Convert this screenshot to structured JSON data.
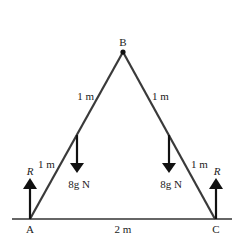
{
  "diagram": {
    "points": {
      "apex": "B",
      "left_base": "A",
      "right_base": "C"
    },
    "labels": {
      "B": "B",
      "A": "A",
      "C": "C",
      "upper_left_length": "1 m",
      "upper_right_length": "1 m",
      "lower_left_length": "1 m",
      "lower_right_length": "1 m",
      "base_length": "2 m",
      "left_weight": "8g N",
      "right_weight": "8g N",
      "left_reaction": "R",
      "right_reaction": "R"
    },
    "colors": {
      "rod": "#3a3a3a",
      "arrow": "#111111",
      "ground": "#333333",
      "text": "#222222"
    }
  }
}
